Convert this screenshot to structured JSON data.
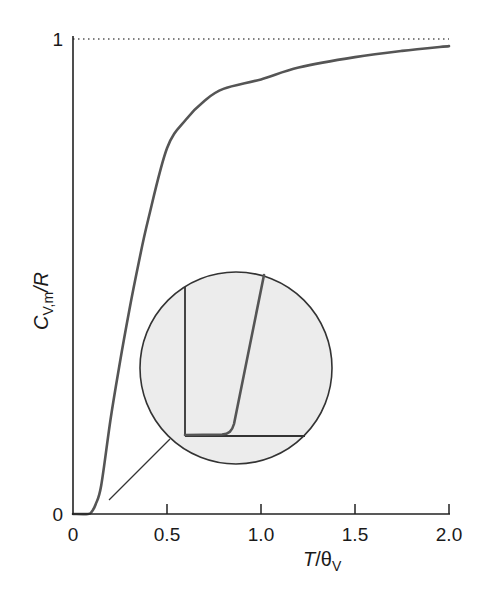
{
  "chart_data": {
    "type": "line",
    "title": "",
    "xlabel": "T/θV",
    "xlabel_parts": {
      "main": "T",
      "sep": "/θ",
      "sub": "V"
    },
    "ylabel": "CV,m/R",
    "ylabel_parts": {
      "main": "C",
      "sub": "V,m",
      "rest": "/R"
    },
    "xlim": [
      0,
      2.0
    ],
    "ylim": [
      0,
      1
    ],
    "x_ticks": [
      0,
      0.5,
      1.0,
      1.5,
      2.0
    ],
    "x_tick_labels": [
      "0",
      "0.5",
      "1.0",
      "1.5",
      "2.0"
    ],
    "y_ticks": [
      0,
      1
    ],
    "y_tick_labels": [
      "0",
      "1"
    ],
    "grid": false,
    "legend": null,
    "series": [
      {
        "name": "Vibrational heat capacity",
        "color": "#555555",
        "x": [
          0.0,
          0.08,
          0.1,
          0.12,
          0.15,
          0.2,
          0.25,
          0.3,
          0.35,
          0.4,
          0.5,
          0.6,
          0.7,
          0.8,
          1.0,
          1.2,
          1.5,
          1.75,
          2.0
        ],
        "values": [
          0.0,
          0.0,
          0.005,
          0.02,
          0.06,
          0.2,
          0.32,
          0.43,
          0.53,
          0.62,
          0.77,
          0.83,
          0.87,
          0.895,
          0.915,
          0.94,
          0.962,
          0.975,
          0.985
        ]
      }
    ],
    "annotations": [
      {
        "type": "asymptote",
        "y": 1,
        "style": "dotted",
        "label": "limit 1"
      },
      {
        "type": "magnified-inset",
        "description": "circular magnifier showing the flat onset of the curve near T/θV ≈ 0.1",
        "fill": "#ececec"
      }
    ]
  },
  "colors": {
    "curve": "#555555",
    "axis": "#222222",
    "inset_fill": "#ececec",
    "inset_border": "#333333"
  }
}
